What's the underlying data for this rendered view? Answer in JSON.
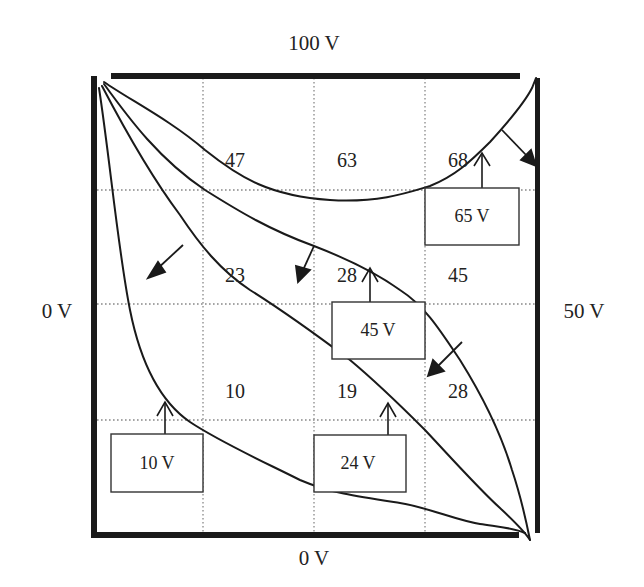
{
  "diagram": {
    "type": "equipotential-field-map",
    "colors": {
      "ink": "#222222",
      "grid": "#888888",
      "background": "#ffffff"
    },
    "boundaries": {
      "top": "100 V",
      "left": "0 V",
      "right": "50 V",
      "bottom": "0 V"
    },
    "grid": {
      "columns": 4,
      "rows": 4,
      "line_style": "dotted"
    },
    "measured_values": [
      {
        "label": "47",
        "x": 235,
        "y": 167
      },
      {
        "label": "63",
        "x": 347,
        "y": 167
      },
      {
        "label": "68",
        "x": 458,
        "y": 167
      },
      {
        "label": "23",
        "x": 235,
        "y": 282
      },
      {
        "label": "28",
        "x": 347,
        "y": 282
      },
      {
        "label": "45",
        "x": 458,
        "y": 282
      },
      {
        "label": "10",
        "x": 235,
        "y": 398
      },
      {
        "label": "19",
        "x": 347,
        "y": 398
      },
      {
        "label": "28",
        "x": 458,
        "y": 398
      }
    ],
    "equipotential_labels": [
      {
        "label": "65 V",
        "box": {
          "x": 425,
          "y": 188,
          "w": 94,
          "h": 57
        }
      },
      {
        "label": "45 V",
        "box": {
          "x": 332,
          "y": 302,
          "w": 93,
          "h": 57
        }
      },
      {
        "label": "10 V",
        "box": {
          "x": 111,
          "y": 434,
          "w": 92,
          "h": 58
        }
      },
      {
        "label": "24 V",
        "box": {
          "x": 314,
          "y": 435,
          "w": 92,
          "h": 57
        }
      }
    ]
  }
}
